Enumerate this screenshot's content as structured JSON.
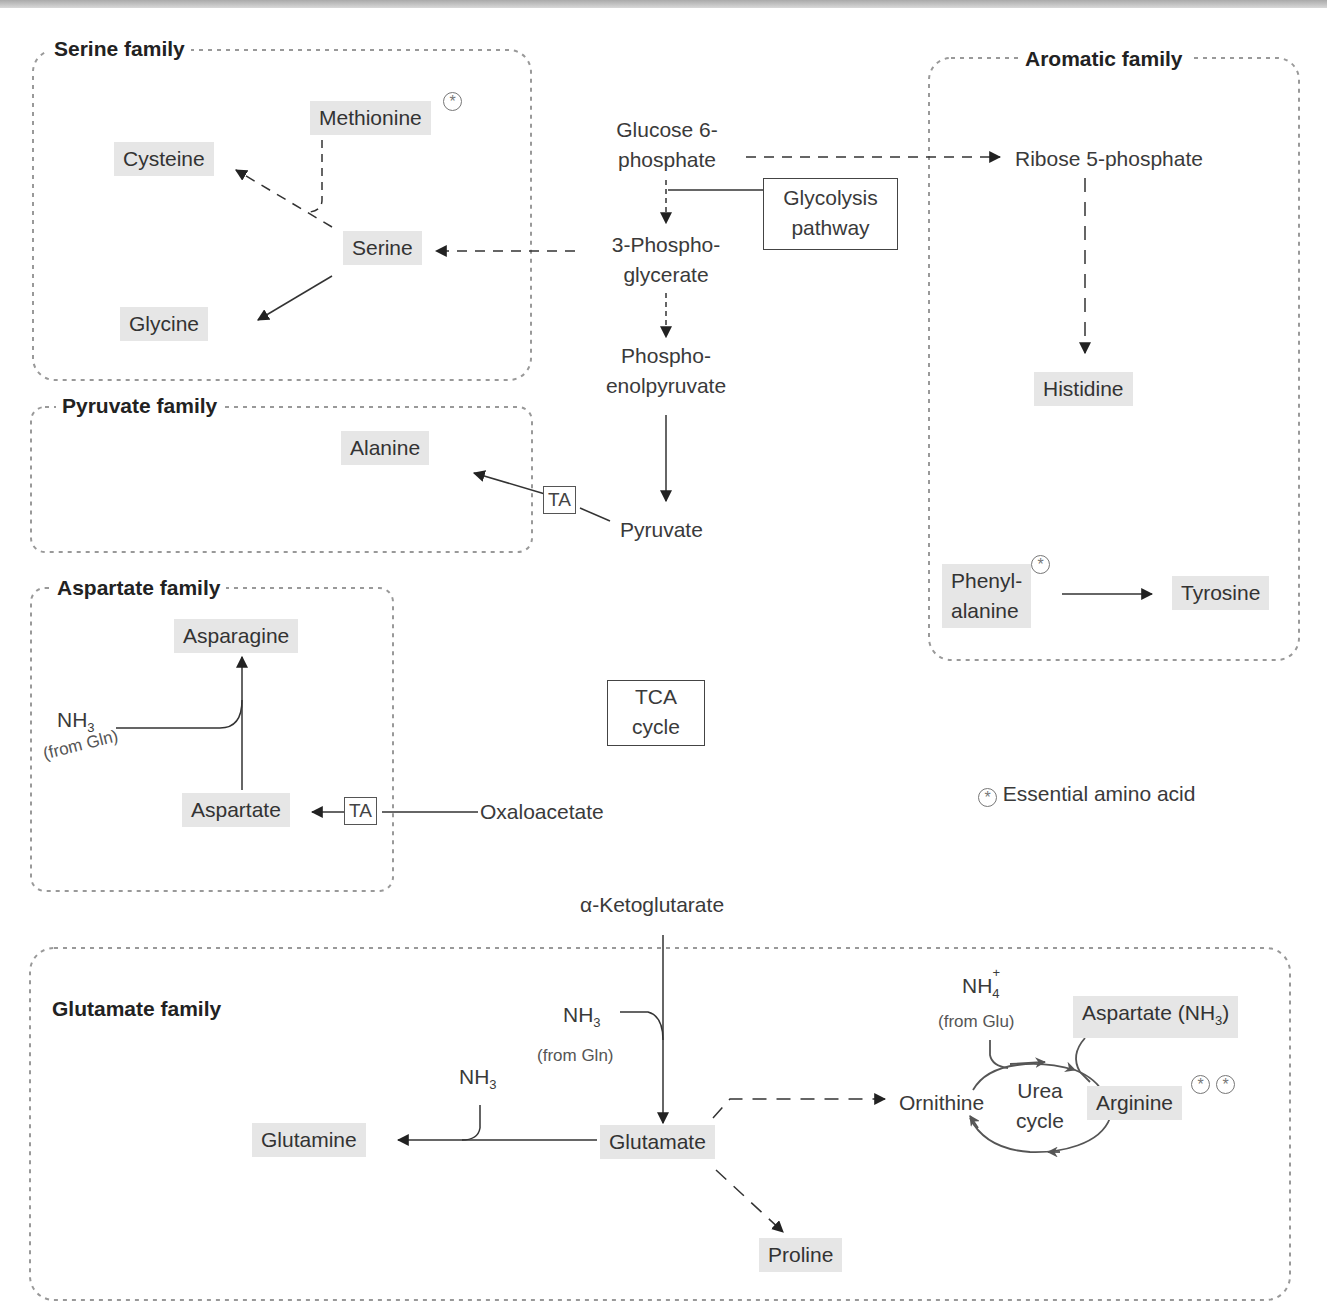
{
  "families": {
    "serine": "Serine family",
    "pyruvate": "Pyruvate family",
    "aspartate": "Aspartate family",
    "aromatic": "Aromatic family",
    "glutamate": "Glutamate family"
  },
  "amino_acids": {
    "methionine": "Methionine",
    "cysteine": "Cysteine",
    "serine": "Serine",
    "glycine": "Glycine",
    "alanine": "Alanine",
    "asparagine": "Asparagine",
    "aspartate": "Aspartate",
    "histidine": "Histidine",
    "phenylalanine_1": "Phenyl-",
    "phenylalanine_2": "alanine",
    "tyrosine": "Tyrosine",
    "glutamine": "Glutamine",
    "glutamate": "Glutamate",
    "proline": "Proline",
    "arginine": "Arginine",
    "aspartate_nh3": "Aspartate (NH",
    "aspartate_nh3_sub": "3",
    "aspartate_nh3_close": ")"
  },
  "intermediates": {
    "g6p_1": "Glucose 6-",
    "g6p_2": "phosphate",
    "pg3_1": "3-Phospho-",
    "pg3_2": "glycerate",
    "pep_1": "Phospho-",
    "pep_2": "enolpyruvate",
    "pyruvate": "Pyruvate",
    "ribose5p": "Ribose 5-phosphate",
    "oxaloacetate": "Oxaloacetate",
    "akg": "α-Ketoglutarate",
    "ornithine": "Ornithine"
  },
  "boxes": {
    "glycolysis_1": "Glycolysis",
    "glycolysis_2": "pathway",
    "tca_1": "TCA",
    "tca_2": "cycle",
    "ta": "TA"
  },
  "cofactors": {
    "nh3": "NH",
    "nh3_sub": "3",
    "nh4": "NH",
    "nh4_sub": "4",
    "nh4_sup": "+",
    "from_gln": "(from Gln)",
    "from_glu": "(from Glu)"
  },
  "urea_cycle": {
    "line1": "Urea",
    "line2": "cycle"
  },
  "legend": {
    "symbol": "⊛",
    "text": "Essential amino acid"
  },
  "essential_marker": "*"
}
